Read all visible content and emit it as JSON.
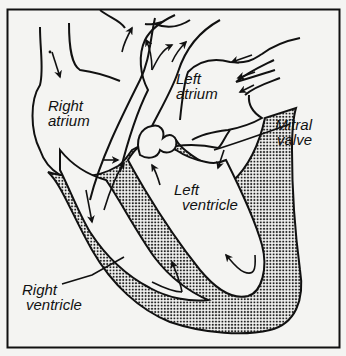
{
  "diagram": {
    "labels": {
      "right_atrium": {
        "line1": "Right",
        "line2": "atrium"
      },
      "left_atrium": {
        "line1": "Left",
        "line2": "atrium"
      },
      "mitral_valve": {
        "line1": "Mitral",
        "line2": "valve"
      },
      "left_ventricle": {
        "line1": "Left",
        "line2": "ventricle"
      },
      "right_ventricle": {
        "line1": "Right",
        "line2": "ventricle"
      }
    },
    "colors": {
      "background": "#f4f4f2",
      "ink": "#111111",
      "stipple": "#333333"
    }
  }
}
